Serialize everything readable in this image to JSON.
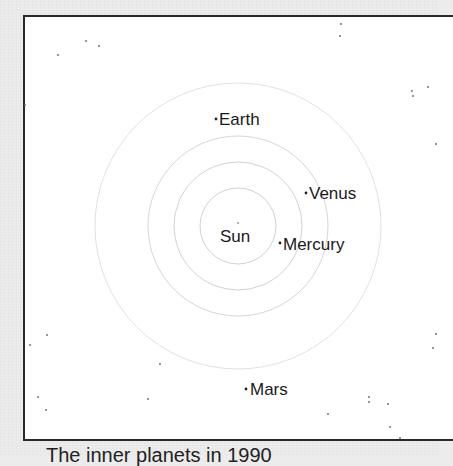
{
  "diagram": {
    "title_caption": "The inner planets in 1990",
    "center": {
      "x": 238,
      "y": 226
    },
    "sun": {
      "label": "Sun"
    },
    "orbits": [
      {
        "name": "mercury-orbit",
        "radius": 38
      },
      {
        "name": "venus-orbit",
        "radius": 64
      },
      {
        "name": "earth-orbit",
        "radius": 90
      },
      {
        "name": "mars-orbit",
        "radius": 143
      }
    ],
    "planets": [
      {
        "name": "Mercury",
        "label": "Mercury",
        "x": 280,
        "y": 243
      },
      {
        "name": "Venus",
        "label": "Venus",
        "x": 306,
        "y": 193
      },
      {
        "name": "Earth",
        "label": "Earth",
        "x": 216,
        "y": 119
      },
      {
        "name": "Mars",
        "label": "Mars",
        "x": 246,
        "y": 389
      }
    ],
    "colors": {
      "orbit": "#d4d4d4",
      "text": "#1a1a1a",
      "frame": "#2a2a2a",
      "background": "#ececec",
      "panel": "#ffffff"
    }
  }
}
